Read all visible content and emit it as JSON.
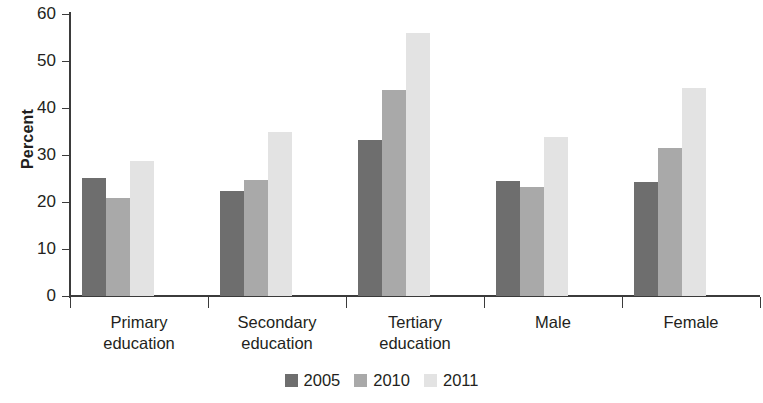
{
  "chart_data": {
    "type": "bar",
    "title": "",
    "subtitle": "",
    "xlabel": "",
    "ylabel": "Percent",
    "ylim": [
      0,
      60
    ],
    "yticks": [
      0,
      10,
      20,
      30,
      40,
      50,
      60
    ],
    "ytick_labels": [
      "0",
      "10",
      "20",
      "30",
      "40",
      "50",
      "60"
    ],
    "grid": false,
    "legend_position": "bottom-center",
    "categories": [
      "Primary education",
      "Secondary education",
      "Tertiary education",
      "Male",
      "Female"
    ],
    "category_lines": [
      [
        "Primary",
        "education"
      ],
      [
        "Secondary",
        "education"
      ],
      [
        "Tertiary",
        "education"
      ],
      [
        "Male"
      ],
      [
        "Female"
      ]
    ],
    "series": [
      {
        "name": "2005",
        "color": "#6e6e6e",
        "values": [
          25.2,
          22.4,
          33.3,
          24.5,
          24.2
        ]
      },
      {
        "name": "2010",
        "color": "#a9a9a9",
        "values": [
          20.9,
          24.7,
          43.9,
          23.2,
          31.5
        ]
      },
      {
        "name": "2011",
        "color": "#e3e3e3",
        "values": [
          28.7,
          35.0,
          56.0,
          33.9,
          44.3
        ]
      }
    ]
  },
  "legend": {
    "items": [
      {
        "label": "2005",
        "color": "#6e6e6e"
      },
      {
        "label": "2010",
        "color": "#a9a9a9"
      },
      {
        "label": "2011",
        "color": "#e3e3e3"
      }
    ]
  },
  "axes": {
    "axis_color": "#3b3b3b",
    "text_color": "#231f20"
  }
}
